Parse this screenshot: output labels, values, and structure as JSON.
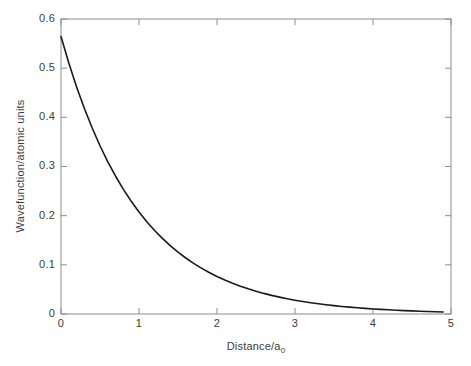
{
  "chart_data": {
    "type": "line",
    "title": "",
    "ylabel": "Wavefunction/atomic units",
    "xlabel_main": "Distance/a",
    "xlabel_sub": "0",
    "xlim": [
      0,
      5
    ],
    "ylim": [
      0,
      0.6
    ],
    "grid": false,
    "box": true,
    "legend": "none",
    "xticks": {
      "values": [
        0,
        1,
        2,
        3,
        4,
        5
      ],
      "labels": [
        "0",
        "1",
        "2",
        "3",
        "4",
        "5"
      ]
    },
    "yticks": {
      "values": [
        0,
        0.1,
        0.2,
        0.3,
        0.4,
        0.5,
        0.6
      ],
      "labels": [
        "0",
        "0.1",
        "0.2",
        "0.3",
        "0.4",
        "0.5",
        "0.6"
      ]
    },
    "series": [
      {
        "name": "hydrogen-1s-wavefunction",
        "x": [
          0,
          0.1,
          0.2,
          0.3,
          0.4,
          0.5,
          0.6,
          0.7,
          0.8,
          0.9,
          1.0,
          1.1,
          1.2,
          1.3,
          1.4,
          1.5,
          1.6,
          1.7,
          1.8,
          1.9,
          2.0,
          2.1,
          2.2,
          2.3,
          2.4,
          2.5,
          2.6,
          2.7,
          2.8,
          2.9,
          3.0,
          3.1,
          3.2,
          3.3,
          3.4,
          3.5,
          3.6,
          3.7,
          3.8,
          3.9,
          4.0,
          4.1,
          4.2,
          4.3,
          4.4,
          4.5,
          4.6,
          4.7,
          4.8,
          4.9
        ],
        "y": [
          0.5642,
          0.5105,
          0.4619,
          0.418,
          0.3782,
          0.3422,
          0.3096,
          0.2802,
          0.2535,
          0.2294,
          0.2076,
          0.1878,
          0.1699,
          0.1538,
          0.1391,
          0.1259,
          0.1139,
          0.1031,
          0.0933,
          0.0844,
          0.0764,
          0.0691,
          0.0625,
          0.0566,
          0.0512,
          0.0463,
          0.0419,
          0.0379,
          0.0343,
          0.031,
          0.0281,
          0.0254,
          0.023,
          0.0208,
          0.0188,
          0.017,
          0.0154,
          0.0139,
          0.0126,
          0.0114,
          0.0103,
          0.0094,
          0.0085,
          0.0077,
          0.0069,
          0.0063,
          0.0057,
          0.0051,
          0.0046,
          0.0042
        ]
      }
    ],
    "colors": {
      "curve": "#1a1a1a",
      "axis": "#8c8c8c",
      "text": "#3d3d3d",
      "background": "#ffffff"
    }
  }
}
